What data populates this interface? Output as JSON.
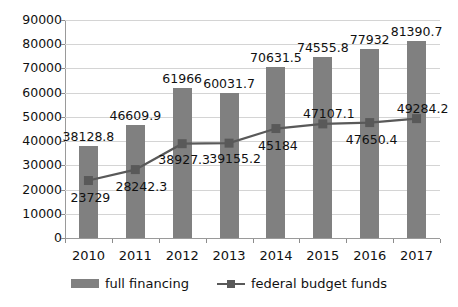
{
  "chart_data": {
    "type": "bar",
    "title": "",
    "subtitle": "",
    "xlabel": "",
    "ylabel": "",
    "categories": [
      "2010",
      "2011",
      "2012",
      "2013",
      "2014",
      "2015",
      "2016",
      "2017"
    ],
    "ylim": [
      0,
      90000
    ],
    "ytick_step": 10000,
    "yticks": [
      "90000",
      "80000",
      "70000",
      "60000",
      "50000",
      "40000",
      "30000",
      "20000",
      "10000",
      "0"
    ],
    "grid": true,
    "legend_position": "bottom",
    "series": [
      {
        "name": "full financing",
        "type": "bar",
        "color": "#808080",
        "values": [
          38128.8,
          46609.9,
          61966,
          60031.7,
          70631.5,
          74555.8,
          77932,
          81390.7
        ],
        "labels": [
          "38128.8",
          "46609.9",
          "61966",
          "60031.7",
          "70631.5",
          "74555.8",
          "77932",
          "81390.7"
        ]
      },
      {
        "name": "federal budget funds",
        "type": "line",
        "color": "#595959",
        "values": [
          23729,
          28242.3,
          38927.3,
          39155.2,
          45184,
          47107.1,
          47650.4,
          49284.2
        ],
        "labels": [
          "23729",
          "28242.3",
          "38927.3",
          "39155.2",
          "45184",
          "47107.1",
          "47650.4",
          "49284.2"
        ]
      }
    ]
  },
  "legend": {
    "items": [
      {
        "label": "full financing",
        "marker": "bar-swatch-icon"
      },
      {
        "label": "federal budget funds",
        "marker": "line-marker-icon"
      }
    ]
  }
}
